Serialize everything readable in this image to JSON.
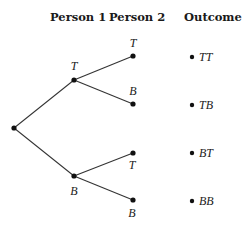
{
  "headers": {
    "person1": "Person 1",
    "person2": "Person 2",
    "outcome": "Outcome"
  },
  "tree": {
    "root": {
      "x": 14,
      "y": 128
    },
    "level1": [
      {
        "label": "T",
        "x": 74,
        "y": 80,
        "label_pos": "above"
      },
      {
        "label": "B",
        "x": 74,
        "y": 176,
        "label_pos": "below"
      }
    ],
    "level2": [
      {
        "label": "T",
        "x": 133,
        "y": 56,
        "parent": 0,
        "label_pos": "above"
      },
      {
        "label": "B",
        "x": 133,
        "y": 104,
        "parent": 0,
        "label_pos": "above"
      },
      {
        "label": "T",
        "x": 133,
        "y": 153,
        "parent": 1,
        "label_pos": "below"
      },
      {
        "label": "B",
        "x": 133,
        "y": 200,
        "parent": 1,
        "label_pos": "below"
      }
    ]
  },
  "outcomes": [
    {
      "label": "TT",
      "y": 56
    },
    {
      "label": "TB",
      "y": 104
    },
    {
      "label": "BT",
      "y": 153
    },
    {
      "label": "BB",
      "y": 200
    }
  ],
  "colors": {
    "line": "#333333",
    "node": "#111111",
    "text": "#1a1a1a"
  }
}
